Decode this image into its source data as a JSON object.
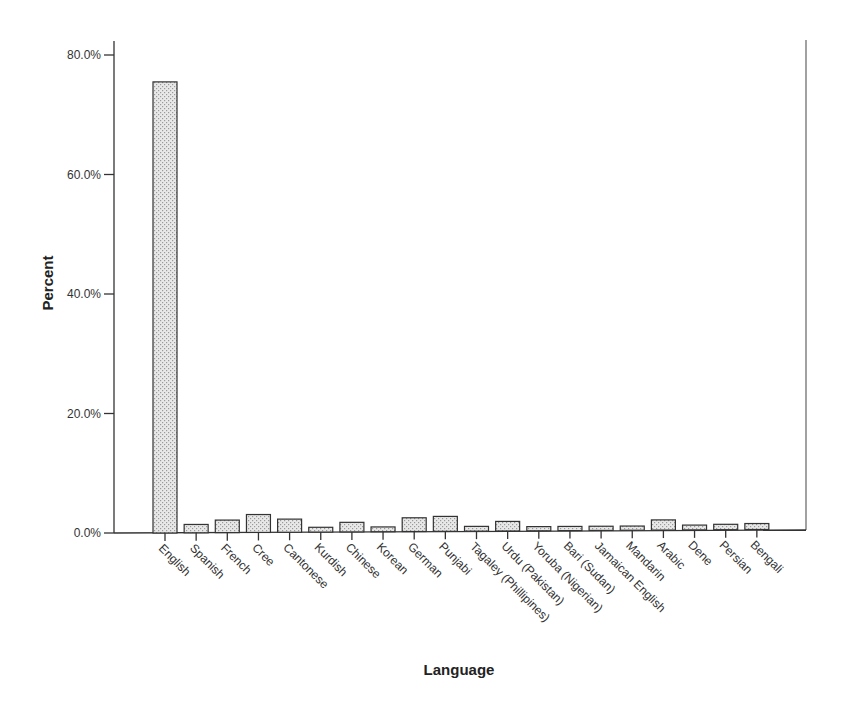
{
  "chart_data": {
    "type": "bar",
    "title": "",
    "xlabel": "Language",
    "ylabel": "Percent",
    "ylim": [
      0,
      80
    ],
    "yticks": [
      0,
      20,
      40,
      60,
      80
    ],
    "ytick_labels": [
      "0.0%",
      "20.0%",
      "40.0%",
      "60.0%",
      "80.0%"
    ],
    "grid": false,
    "legend": null,
    "categories": [
      "English",
      "Spanish",
      "French",
      "Cree",
      "Cantonese",
      "Kurdish",
      "Chinese",
      "Korean",
      "German",
      "Punjabi",
      "Tagaley (Phillipines)",
      "Urdu (Pakistan)",
      "Yoruba (Nigerian)",
      "Bari (Sudan)",
      "Jamaican English",
      "Mandarin",
      "Arabic",
      "Dene",
      "Persian",
      "Bengali"
    ],
    "values": [
      75.5,
      1.4,
      2.1,
      3.0,
      2.2,
      0.8,
      1.6,
      0.8,
      2.3,
      2.5,
      0.8,
      1.6,
      0.7,
      0.7,
      0.7,
      0.7,
      1.7,
      0.8,
      0.9,
      1.0
    ],
    "bar_fill": "#e6e6e6",
    "bar_pattern_dot": "#9a9a9a",
    "bar_stroke": "#333333",
    "axis_color": "#333333"
  }
}
